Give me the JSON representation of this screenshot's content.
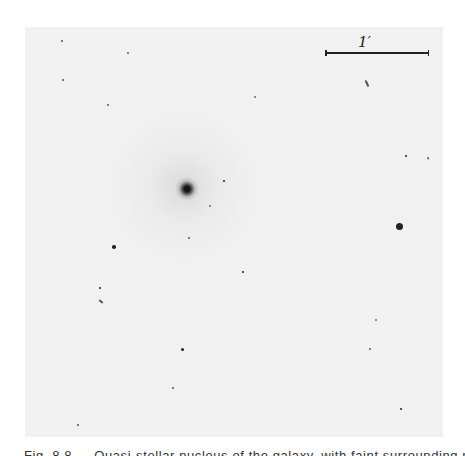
{
  "figure": {
    "scale_bar": {
      "label": "1′"
    },
    "caption": "Fig. 8.8 — Quasi-stellar nucleus of the galaxy, with faint surrounding nebulosity",
    "colors": {
      "background": "#ffffff",
      "plate": "#f1f1f1",
      "ink": "#222222"
    }
  },
  "objects": {
    "nucleus": {
      "x": 187,
      "y": 189,
      "size": 24
    },
    "stars": [
      {
        "x": 399,
        "y": 226,
        "r": 3.5
      },
      {
        "x": 114,
        "y": 247,
        "r": 1.8
      },
      {
        "x": 100,
        "y": 288,
        "r": 1.4
      },
      {
        "x": 243,
        "y": 272,
        "r": 1.4
      },
      {
        "x": 182,
        "y": 349,
        "r": 1.5
      },
      {
        "x": 406,
        "y": 156,
        "r": 1.2
      },
      {
        "x": 224,
        "y": 181,
        "r": 1.2
      },
      {
        "x": 210,
        "y": 206,
        "r": 1
      },
      {
        "x": 376,
        "y": 320,
        "r": 1
      },
      {
        "x": 370,
        "y": 349,
        "r": 0.9
      },
      {
        "x": 401,
        "y": 409,
        "r": 1.2
      },
      {
        "x": 255,
        "y": 97,
        "r": 1
      },
      {
        "x": 128,
        "y": 53,
        "r": 0.9
      },
      {
        "x": 62,
        "y": 41,
        "r": 0.8
      },
      {
        "x": 108,
        "y": 105,
        "r": 0.8
      },
      {
        "x": 63,
        "y": 80,
        "r": 0.8
      },
      {
        "x": 173,
        "y": 388,
        "r": 0.8
      },
      {
        "x": 78,
        "y": 425,
        "r": 0.8
      },
      {
        "x": 428,
        "y": 158,
        "r": 0.8
      },
      {
        "x": 189,
        "y": 238,
        "r": 0.8
      }
    ]
  }
}
